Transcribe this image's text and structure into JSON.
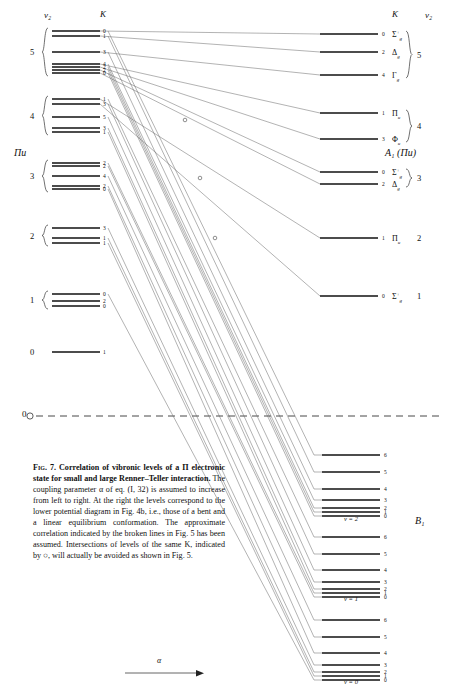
{
  "figure": {
    "headers": {
      "left_v2": "v₂",
      "left_K": "K",
      "right_K": "K",
      "right_v2": "v₂",
      "left_state": "Πu",
      "right_state": "A₁ (Πu)",
      "lower_state": "B₁",
      "baseline_zero": "0",
      "axis_arrow_label": "α"
    },
    "left_groups": [
      {
        "v2": "5",
        "y": 30,
        "levels": [
          {
            "K": "0",
            "y": 31
          },
          {
            "K": "1",
            "y": 36
          },
          {
            "K": "3",
            "y": 52
          },
          {
            "K": "4",
            "y": 64
          },
          {
            "K": "2",
            "y": 67
          },
          {
            "K": "2",
            "y": 70
          },
          {
            "K": "0",
            "y": 73
          }
        ]
      },
      {
        "v2": "4",
        "y": 105,
        "levels": [
          {
            "K": "1",
            "y": 99
          },
          {
            "K": "3",
            "y": 104
          },
          {
            "K": "5",
            "y": 117
          },
          {
            "K": "3",
            "y": 128
          },
          {
            "K": "1",
            "y": 132
          }
        ]
      },
      {
        "v2": "3",
        "y": 172,
        "levels": [
          {
            "K": "2",
            "y": 163
          },
          {
            "K": "2",
            "y": 166
          },
          {
            "K": "4",
            "y": 176
          },
          {
            "K": "2",
            "y": 186
          },
          {
            "K": "0",
            "y": 189
          }
        ]
      },
      {
        "v2": "2",
        "y": 236,
        "levels": [
          {
            "K": "3",
            "y": 228
          },
          {
            "K": "1",
            "y": 238
          },
          {
            "K": "1",
            "y": 243
          }
        ]
      },
      {
        "v2": "1",
        "y": 300,
        "levels": [
          {
            "K": "0",
            "y": 294
          },
          {
            "K": "2",
            "y": 301
          },
          {
            "K": "0",
            "y": 306
          }
        ]
      },
      {
        "v2": "0",
        "y": 352,
        "levels": [
          {
            "K": "1",
            "y": 352
          }
        ]
      }
    ],
    "right_groups": [
      {
        "v2": "5",
        "levels": [
          {
            "K": "0",
            "term": "Σ",
            "supersc": "+",
            "subsc": "g",
            "y": 34
          },
          {
            "K": "2",
            "term": "Δ",
            "supersc": "",
            "subsc": "g",
            "y": 52
          },
          {
            "K": "4",
            "term": "Γ",
            "supersc": "",
            "subsc": "g",
            "y": 75
          }
        ]
      },
      {
        "v2": "4",
        "levels": [
          {
            "K": "1",
            "term": "Π",
            "supersc": "",
            "subsc": "u",
            "y": 113
          },
          {
            "K": "3",
            "term": "Φ",
            "supersc": "",
            "subsc": "u",
            "y": 139
          }
        ]
      },
      {
        "v2": "3",
        "levels": [
          {
            "K": "0",
            "term": "Σ",
            "supersc": "+",
            "subsc": "g",
            "y": 172
          },
          {
            "K": "2",
            "term": "Δ",
            "supersc": "",
            "subsc": "g",
            "y": 184
          }
        ]
      },
      {
        "v2": "2",
        "levels": [
          {
            "K": "1",
            "term": "Π",
            "supersc": "",
            "subsc": "u",
            "y": 238
          }
        ]
      },
      {
        "v2": "1",
        "levels": [
          {
            "K": "0",
            "term": "Σ",
            "supersc": "+",
            "subsc": "g",
            "y": 296
          }
        ]
      }
    ],
    "lower_groups": [
      {
        "v": "v = 2",
        "label_y": 521,
        "levels": [
          {
            "K": "6",
            "y": 455
          },
          {
            "K": "5",
            "y": 472
          },
          {
            "K": "4",
            "y": 489
          },
          {
            "K": "3",
            "y": 500
          },
          {
            "K": "2",
            "y": 508
          },
          {
            "K": "1",
            "y": 512
          },
          {
            "K": "0",
            "y": 516
          }
        ]
      },
      {
        "v": "v = 1",
        "label_y": 601,
        "levels": [
          {
            "K": "6",
            "y": 537
          },
          {
            "K": "5",
            "y": 554
          },
          {
            "K": "4",
            "y": 570
          },
          {
            "K": "3",
            "y": 582
          },
          {
            "K": "2",
            "y": 589
          },
          {
            "K": "1",
            "y": 593
          },
          {
            "K": "0",
            "y": 597
          }
        ]
      },
      {
        "v": "v = 0",
        "label_y": 684,
        "levels": [
          {
            "K": "6",
            "y": 620
          },
          {
            "K": "5",
            "y": 637
          },
          {
            "K": "4",
            "y": 653
          },
          {
            "K": "3",
            "y": 665
          },
          {
            "K": "2",
            "y": 672
          },
          {
            "K": "1",
            "y": 676
          },
          {
            "K": "0",
            "y": 680
          }
        ]
      }
    ],
    "caption": {
      "fig_label": "Fig. 7.",
      "bold_text": "Correlation of vibronic levels of a Π electronic state for small and large Renner–Teller interaction.",
      "body_text": " The coupling parameter α of eq. (I, 32) is assumed to increase from left to right. At the right the levels correspond to the lower potential diagram in Fig. 4b, i.e., those of a bent and a linear equilibrium conformation. The approximate correlation indicated by the broken lines in Fig. 5 has been assumed. Intersections of levels of the same K, indicated by ○, will actually be avoided as shown in Fig. 5."
    },
    "colors": {
      "ink": "#111111",
      "line": "#555555",
      "paper": "#ffffff"
    }
  }
}
